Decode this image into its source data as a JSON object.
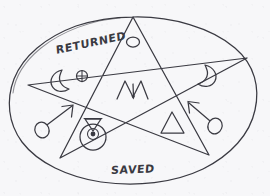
{
  "canvas": {
    "width": 270,
    "height": 196,
    "background_color": "#f7f7f9",
    "ink_color": "#3a3a42",
    "medium": "hand-drawn pen sketch on paper"
  },
  "labels": {
    "top_text": "RETURNED",
    "bottom_text": "SAVED"
  },
  "figure": {
    "outer_shape": "hand-drawn ellipse",
    "inner_shape": "five-pointed star (pentagram), single continuous stroke"
  },
  "symbols": {
    "top_point": {
      "name": "circle-symbol",
      "description": "small open circle / ellipse",
      "region": "top star point"
    },
    "left_point_moon": {
      "name": "crescent-moon-right-icon",
      "description": "crescent moon opening to the right",
      "region": "left star point"
    },
    "left_point_earth": {
      "name": "earth-symbol-icon",
      "description": "circle with cross inside (Earth)",
      "region": "left star point"
    },
    "right_point_moon": {
      "name": "crescent-moon-left-icon",
      "description": "crescent moon opening to the left",
      "region": "right star point"
    },
    "center": {
      "name": "aries-m-glyph-icon",
      "description": "M-shaped glyph with descending center tail",
      "region": "center pentagon"
    },
    "lower_left_mars": {
      "name": "mars-symbol-right-icon",
      "description": "circle with arrow pointing up-right (Mars)",
      "region": "lower left of ellipse"
    },
    "lower_right_mars": {
      "name": "mars-symbol-left-icon",
      "description": "circle with arrow pointing up-left (mirrored Mars)",
      "region": "lower right of ellipse"
    },
    "bottom_sun": {
      "name": "sun-symbol-icon",
      "description": "circle with central dot topped by an inverted funnel triangle",
      "region": "bottom center, lower-left star point"
    },
    "bottom_triangle": {
      "name": "triangle-symbol-icon",
      "description": "upward-pointing open triangle (fire)",
      "region": "lower right star point"
    }
  }
}
